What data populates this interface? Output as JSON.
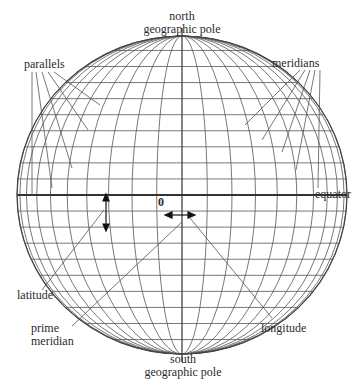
{
  "diagram": {
    "labels": {
      "north_pole": [
        "north",
        "geographic pole"
      ],
      "south_pole": [
        "south",
        "geographic pole"
      ],
      "parallels": "parallels",
      "meridians": "meridians",
      "equator": "equator",
      "origin": "0",
      "latitude": "latitude",
      "prime_meridian": [
        "prime",
        "meridian"
      ],
      "longitude": "longitude"
    },
    "sphere": {
      "cx": 182,
      "cy": 195,
      "rx": 165,
      "ry": 159
    },
    "grid": {
      "parallel_count_per_hemisphere": 9,
      "meridian_count": 21
    },
    "colors": {
      "line": "#444444",
      "text": "#2a2a2a",
      "background": "#ffffff"
    }
  }
}
